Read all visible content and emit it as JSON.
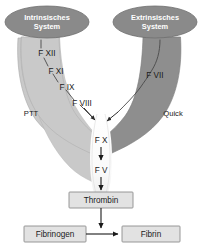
{
  "diagram": {
    "colors": {
      "background": "#ffffff",
      "ellipse_fill": "#8a8a8a",
      "ellipse_stroke": "#6e6e6e",
      "ellipse_text": "#ffffff",
      "left_branch_fill": "#c9c9c9",
      "left_branch_stroke": "#a8a8a8",
      "right_branch_fill": "#8e8e8e",
      "right_branch_stroke": "#767676",
      "funnel_fill": "#fbfbfb",
      "arrow": "#1a1a1a",
      "pathway_line": "#4a4a4a",
      "box_fill": "#e2e2e2",
      "box_stroke": "#8c8c8c",
      "text": "#1a1a1a"
    },
    "pathways": {
      "intrinsic": {
        "name": "Intrinsisches System",
        "name_line1": "Intrinsisches",
        "name_line2": "System",
        "test": "PTT",
        "factors": [
          {
            "label": "F XII"
          },
          {
            "label": "F XI"
          },
          {
            "label": "F IX"
          },
          {
            "label": "F VIII"
          }
        ]
      },
      "extrinsic": {
        "name": "Extrinsisches System",
        "name_line1": "Extrinsisches",
        "name_line2": "System",
        "test": "Quick",
        "factors": [
          {
            "label": "F VII"
          }
        ]
      }
    },
    "common_pathway": {
      "factors": [
        {
          "label": "F X"
        },
        {
          "label": "F V"
        }
      ]
    },
    "boxes": [
      {
        "label": "Thrombin"
      },
      {
        "label": "Fibrinogen"
      },
      {
        "label": "Fibrin"
      }
    ]
  }
}
